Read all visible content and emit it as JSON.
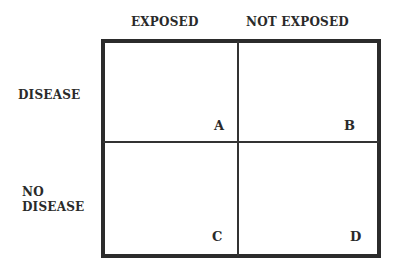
{
  "columns": [
    {
      "label": "EXPOSED"
    },
    {
      "label": "NOT EXPOSED"
    }
  ],
  "rows": [
    {
      "label_lines": [
        "DISEASE"
      ]
    },
    {
      "label_lines": [
        "NO",
        "DISEASE"
      ]
    }
  ],
  "cells": [
    {
      "label": "A",
      "row": 0,
      "col": 0
    },
    {
      "label": "B",
      "row": 0,
      "col": 1
    },
    {
      "label": "C",
      "row": 1,
      "col": 0
    },
    {
      "label": "D",
      "row": 1,
      "col": 1
    }
  ],
  "colors": {
    "border": "#2b2b2b",
    "text": "#2a2a2a",
    "background": "#ffffff"
  }
}
